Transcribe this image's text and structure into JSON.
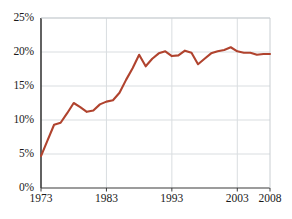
{
  "chart_data": {
    "type": "line",
    "title": "",
    "xlabel": "",
    "ylabel": "",
    "xlim": [
      1973,
      2008
    ],
    "ylim": [
      0,
      25
    ],
    "grid": true,
    "legend": "none",
    "line_color": "#b0432e",
    "axis_color": "#3a3a3a",
    "grid_color": "#d9dde0",
    "y_ticks": [
      "0%",
      "5%",
      "10%",
      "15%",
      "20%",
      "25%"
    ],
    "y_tick_values": [
      0,
      5,
      10,
      15,
      20,
      25
    ],
    "x_ticks": [
      "1973",
      "1983",
      "1993",
      "2003",
      "2008"
    ],
    "x_tick_values": [
      1973,
      1983,
      1993,
      2003,
      2008
    ],
    "series": [
      {
        "name": "share",
        "x": [
          1973,
          1974,
          1975,
          1976,
          1977,
          1978,
          1979,
          1980,
          1981,
          1982,
          1983,
          1984,
          1985,
          1986,
          1987,
          1988,
          1989,
          1990,
          1991,
          1992,
          1993,
          1994,
          1995,
          1996,
          1997,
          1998,
          1999,
          2000,
          2001,
          2002,
          2003,
          2004,
          2005,
          2006,
          2007,
          2008
        ],
        "values": [
          4.7,
          7.0,
          9.3,
          9.6,
          11.0,
          12.5,
          11.9,
          11.2,
          11.4,
          12.3,
          12.7,
          12.9,
          14.0,
          15.9,
          17.6,
          19.6,
          17.9,
          19.0,
          19.8,
          20.1,
          19.4,
          19.5,
          20.2,
          19.9,
          18.2,
          19.0,
          19.8,
          20.1,
          20.3,
          20.7,
          20.1,
          19.9,
          19.9,
          19.6,
          19.7,
          19.7
        ]
      }
    ]
  }
}
